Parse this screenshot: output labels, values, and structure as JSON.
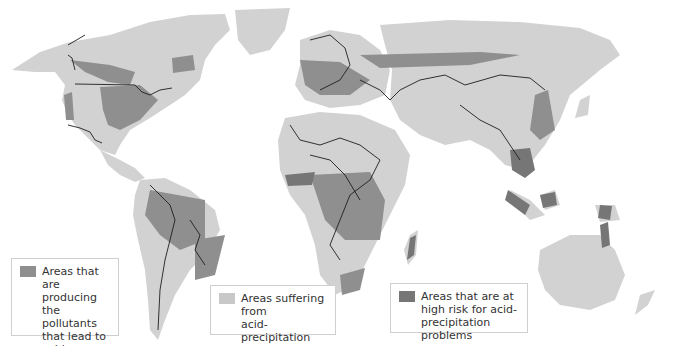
{
  "map": {
    "colors": {
      "background": "#ffffff",
      "land": "#d2d2d2",
      "producing": "#8f8f8f",
      "suffering": "#c8c8c8",
      "high_risk": "#767676",
      "border": "#1e1e1e"
    }
  },
  "legend": [
    {
      "id": "producing",
      "label": "Areas that are\nproducing\nthe pollutants\nthat lead to\nacid precipitation",
      "color": "#8f8f8f"
    },
    {
      "id": "suffering",
      "label": "Areas suffering from\nacid-precipitation\nproblems",
      "color": "#c8c8c8"
    },
    {
      "id": "high_risk",
      "label": "Areas that are at\nhigh risk for acid-\nprecipitation problems",
      "color": "#767676"
    }
  ]
}
